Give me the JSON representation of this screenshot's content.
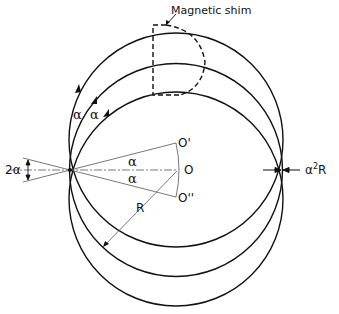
{
  "diagram": {
    "labels": {
      "shim": "Magnetic shim",
      "alpha_left_1": "α",
      "alpha_left_2": "α",
      "alpha_upper": "α",
      "alpha_lower": "α",
      "two_alpha": "2α",
      "center_O": "O",
      "center_O_prime": "O'",
      "center_O_double_prime": "O''",
      "radius": "R",
      "aberration_prefix": "α",
      "aberration_exp": "2",
      "aberration_suffix": "R"
    },
    "geometry": {
      "source_point": [
        70,
        170
      ],
      "circles": [
        {
          "name": "upper-trajectory",
          "center": [
            175,
            143
          ],
          "r": 108
        },
        {
          "name": "central-trajectory",
          "center": [
            177,
            170
          ],
          "r": 107
        },
        {
          "name": "lower-trajectory",
          "center": [
            175,
            196
          ],
          "r": 109
        }
      ]
    },
    "colors": {
      "stroke": "#111111",
      "thin_stroke": "#555555",
      "background": "#ffffff"
    }
  }
}
